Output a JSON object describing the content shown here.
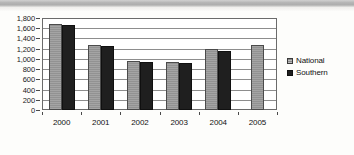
{
  "chart_data": {
    "type": "bar",
    "title": "",
    "subtitle": "",
    "xlabel": "",
    "ylabel": "",
    "categories": [
      "2000",
      "2001",
      "2002",
      "2003",
      "2004",
      "2005"
    ],
    "series": [
      {
        "name": "National",
        "color": "#9a9a9a",
        "values": [
          1680,
          1280,
          965,
          945,
          1190,
          1270
        ]
      },
      {
        "name": "Southern",
        "color": "#1f1f1f",
        "values": [
          1660,
          1250,
          935,
          915,
          1150,
          null
        ]
      }
    ],
    "ylim": [
      0,
      1800
    ],
    "ytick_step": 200,
    "ytick_labels": [
      "1,800",
      "1,600",
      "1,400",
      "1,200",
      "1,000",
      "800",
      "600",
      "400",
      "200",
      "0"
    ],
    "ytick_values": [
      1800,
      1600,
      1400,
      1200,
      1000,
      800,
      600,
      400,
      200,
      0
    ],
    "grid": true,
    "grid_axis": "y",
    "legend_position": "right",
    "legend_entries": [
      "National",
      "Southern"
    ]
  }
}
